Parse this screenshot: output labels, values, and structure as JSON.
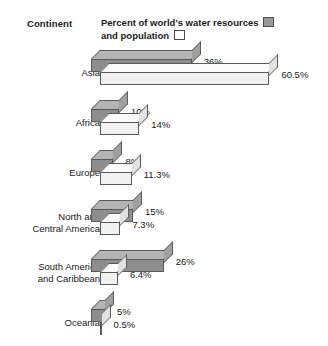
{
  "header": {
    "continent_column_label": "Continent",
    "legend_line1_text": "Percent of world's water resources",
    "legend_line2_text": "and population",
    "legend_swatch1_name": "water-resources-swatch",
    "legend_swatch2_name": "population-swatch"
  },
  "colors": {
    "series_water_front": "#8e8e8e",
    "series_water_top": "#b4b4b4",
    "series_population_front": "#f2f2f2",
    "series_population_top": "#fbfbfb",
    "outline": "#5a5a5a",
    "background": "#ffffff",
    "text": "#1a1a1a"
  },
  "chart_data": {
    "type": "bar",
    "orientation": "horizontal",
    "style": "3d-grouped-horizontal-bars",
    "title": "Percent of world's water resources and population",
    "xlabel": "",
    "ylabel": "Continent",
    "grid": false,
    "legend_position": "top-right",
    "xlim": [
      0,
      60.5
    ],
    "value_suffix": "%",
    "categories": [
      "Asia",
      "Africa",
      "Europe",
      "North and Central America",
      "South America and Caribbean",
      "Oceania"
    ],
    "series": [
      {
        "name": "Percent of world's water resources",
        "values": [
          36,
          10,
          8,
          15,
          26,
          5
        ],
        "labels": [
          "36%",
          "10%",
          "8%",
          "15%",
          "26%",
          "5%"
        ]
      },
      {
        "name": "and population",
        "values": [
          60.5,
          14,
          11.3,
          7.3,
          6.4,
          0.5
        ],
        "labels": [
          "60.5%",
          "14%",
          "11.3%",
          "7.3%",
          "6.4%",
          "0.5%"
        ]
      }
    ]
  },
  "rows": [
    {
      "label_line1": "Asia",
      "label_line2": "",
      "water_label": "36%",
      "population_label": "60.5%"
    },
    {
      "label_line1": "Africa",
      "label_line2": "",
      "water_label": "10%",
      "population_label": "14%"
    },
    {
      "label_line1": "Europe",
      "label_line2": "",
      "water_label": "8%",
      "population_label": "11.3%"
    },
    {
      "label_line1": "North and",
      "label_line2": "Central America",
      "water_label": "15%",
      "population_label": "7.3%"
    },
    {
      "label_line1": "South America",
      "label_line2": "and Caribbean",
      "water_label": "26%",
      "population_label": "6.4%"
    },
    {
      "label_line1": "Oceania",
      "label_line2": "",
      "water_label": "5%",
      "population_label": "0.5%"
    }
  ]
}
